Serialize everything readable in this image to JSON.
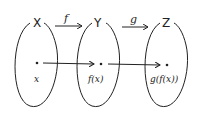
{
  "diagram": {
    "sets": [
      {
        "name": "X",
        "element_label": "x"
      },
      {
        "name": "Y",
        "element_label": "f(x)"
      },
      {
        "name": "Z",
        "element_label": "g(f(x))"
      }
    ],
    "maps": [
      {
        "name": "f",
        "from": "X",
        "to": "Y"
      },
      {
        "name": "g",
        "from": "Y",
        "to": "Z"
      }
    ],
    "stroke_color": "#222222"
  }
}
